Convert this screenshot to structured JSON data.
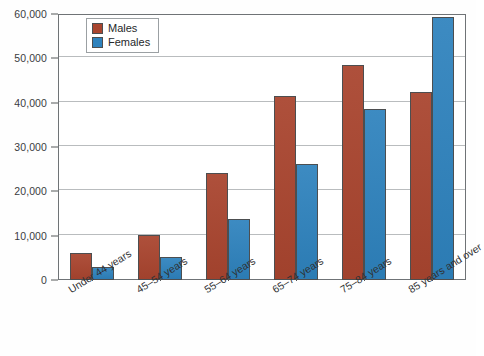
{
  "chart_data": {
    "type": "bar",
    "title": "",
    "subtitle": "",
    "xlabel": "",
    "ylabel": "",
    "categories": [
      "Under 44 years",
      "45–54 years",
      "55–64 years",
      "65–74 years",
      "75–84 years",
      "85 years and over"
    ],
    "series": [
      {
        "name": "Males",
        "color": "#a9452f",
        "values": [
          6000,
          10200,
          24200,
          41400,
          48600,
          42400
        ]
      },
      {
        "name": "Females",
        "color": "#2e82bd",
        "values": [
          3000,
          5300,
          13800,
          26200,
          38600,
          59400
        ]
      }
    ],
    "ylim": [
      0,
      60000
    ],
    "y_ticks": [
      0,
      10000,
      20000,
      30000,
      40000,
      50000,
      60000
    ],
    "y_tick_labels": [
      "0",
      "10,000",
      "20,000",
      "30,000",
      "40,000",
      "50,000",
      "60,000"
    ],
    "grid": true,
    "legend_position": "top-left",
    "legend_entries": [
      {
        "label": "Males",
        "swatch": "males-swatch"
      },
      {
        "label": "Females",
        "swatch": "females-swatch"
      }
    ]
  },
  "colors": {
    "males": "#a9452f",
    "females": "#2e82bd",
    "gridline": "#b9bcbe",
    "frame": "#6f7376",
    "background": "#ffffff",
    "text": "#2f3133"
  }
}
